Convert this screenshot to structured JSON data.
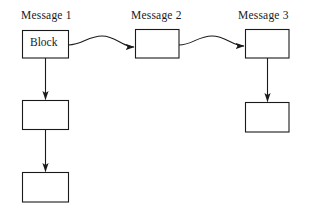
{
  "diagram": {
    "title_labels": [
      {
        "id": "message-1",
        "text": "Message 1"
      },
      {
        "id": "message-2",
        "text": "Message 2"
      },
      {
        "id": "message-3",
        "text": "Message 3"
      }
    ],
    "colors": {
      "background": "#ffffff",
      "stroke": "#1a1a1a",
      "text": "#1a1a1a",
      "box_fill": "#ffffff"
    },
    "boxes": [
      {
        "id": "message-1-block",
        "label": "Block",
        "x": 22,
        "y": 30,
        "width": 46,
        "height": 28,
        "column": "message-1",
        "row": 1
      },
      {
        "id": "message-1-box-2",
        "label": "",
        "x": 22,
        "y": 100,
        "width": 46,
        "height": 29,
        "column": "message-1",
        "row": 2
      },
      {
        "id": "message-1-box-3",
        "label": "",
        "x": 22,
        "y": 172,
        "width": 46,
        "height": 30,
        "column": "message-1",
        "row": 3
      },
      {
        "id": "message-2-box-1",
        "label": "",
        "x": 135,
        "y": 29,
        "width": 44,
        "height": 29,
        "column": "message-2",
        "row": 1
      },
      {
        "id": "message-3-box-1",
        "label": "",
        "x": 245,
        "y": 29,
        "width": 44,
        "height": 29,
        "column": "message-3",
        "row": 1
      },
      {
        "id": "message-3-box-2",
        "label": "",
        "x": 245,
        "y": 102,
        "width": 44,
        "height": 30,
        "column": "message-3",
        "row": 2
      }
    ],
    "connectors": [
      {
        "id": "block-to-message-2",
        "kind": "wavy-arrow",
        "from": "message-1-block",
        "to": "message-2-box-1"
      },
      {
        "id": "message-2-to-message-3",
        "kind": "wavy-arrow",
        "from": "message-2-box-1",
        "to": "message-3-box-1"
      },
      {
        "id": "block-to-box-2",
        "kind": "vertical-arrow",
        "from": "message-1-block",
        "to": "message-1-box-2"
      },
      {
        "id": "box-2-to-box-3",
        "kind": "vertical-arrow",
        "from": "message-1-box-2",
        "to": "message-1-box-3"
      },
      {
        "id": "message-3-box-1-to-box-2",
        "kind": "vertical-arrow",
        "from": "message-3-box-1",
        "to": "message-3-box-2"
      }
    ]
  }
}
